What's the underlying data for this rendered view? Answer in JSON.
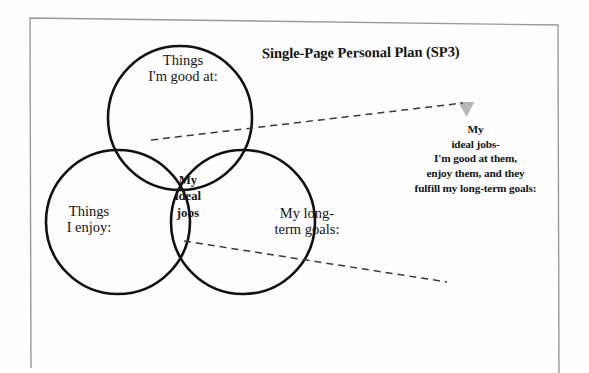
{
  "page": {
    "background_color": "#fefefe",
    "border_color": "#9a9a9a"
  },
  "diagram": {
    "title": "Single-Page Personal Plan (SP3)",
    "type": "venn-diagram-3-circle",
    "stroke_color": "#111111",
    "shade_color": "#b6b6b6",
    "circles": [
      {
        "id": "good-at",
        "label": "Things\nI'm good at:",
        "position": "top",
        "cx": 180,
        "cy": 118,
        "r": 72
      },
      {
        "id": "enjoy",
        "label": "Things\nI enjoy:",
        "position": "bottom-left",
        "cx": 118,
        "cy": 222,
        "r": 72
      },
      {
        "id": "long-term-goals",
        "label": "My long-\nterm goals:",
        "position": "bottom-right",
        "cx": 243,
        "cy": 222,
        "r": 72
      }
    ],
    "intersection": {
      "id": "ideal-jobs",
      "label": "My\nideal\njobs",
      "fill": "#b6b6b6"
    }
  },
  "callout": {
    "id": "ideal-jobs-magnified",
    "text": "My\nideal jobs-\nI'm good at them,\nenjoy them, and they\nfulfill my long-term goals:",
    "fill": "#b6b6b6",
    "connector_style": "dashed",
    "connector_color": "#3a3a3a"
  }
}
